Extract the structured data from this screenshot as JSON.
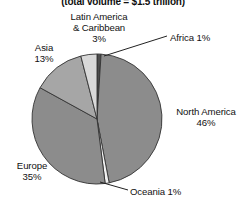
{
  "chart_data": {
    "type": "pie",
    "title": "(total volume = $1.5 trillion)",
    "subtitle": "",
    "xlabel": "",
    "ylabel": "",
    "legend_position": "none",
    "grid": false,
    "categories": [
      "Africa",
      "North America",
      "Oceania",
      "Europe",
      "Asia",
      "Latin America & Caribbean"
    ],
    "values": [
      1,
      46,
      1,
      35,
      13,
      3
    ],
    "units": "percent",
    "slices": [
      {
        "name": "Africa",
        "label_line1": "Africa 1%",
        "label_line2": "",
        "value": 1,
        "percent_text": "1%",
        "color": "#4d4d4d",
        "start_deg": 0,
        "end_deg": 3.6,
        "has_leader_line": true
      },
      {
        "name": "North America",
        "label_line1": "North America",
        "label_line2": "46%",
        "value": 46,
        "percent_text": "46%",
        "color": "#8c8c8c",
        "start_deg": 3.6,
        "end_deg": 169.2,
        "has_leader_line": false
      },
      {
        "name": "Oceania",
        "label_line1": "Oceania 1%",
        "label_line2": "",
        "value": 1,
        "percent_text": "1%",
        "color": "#f2f2f2",
        "start_deg": 169.2,
        "end_deg": 172.8,
        "has_leader_line": true
      },
      {
        "name": "Europe",
        "label_line1": "Europe",
        "label_line2": "35%",
        "value": 35,
        "percent_text": "35%",
        "color": "#8c8c8c",
        "start_deg": 172.8,
        "end_deg": 298.8,
        "has_leader_line": false
      },
      {
        "name": "Asia",
        "label_line1": "Asia",
        "label_line2": "13%",
        "value": 13,
        "percent_text": "13%",
        "color": "#a6a6a6",
        "start_deg": 298.8,
        "end_deg": 345.6,
        "has_leader_line": false
      },
      {
        "name": "Latin America & Caribbean",
        "label_line1": "Latin America",
        "label_line2": "& Caribbean",
        "label_line3": "3%",
        "value": 3,
        "percent_text": "3%",
        "color": "#d9d9d9",
        "start_deg": 345.6,
        "end_deg": 360,
        "has_leader_line": false
      }
    ],
    "geometry": {
      "center_x": 97,
      "center_y": 119,
      "radius": 65
    },
    "style": {
      "slice_outline_color": "#333333",
      "background": "#ffffff",
      "leader_line_color": "#222222"
    }
  },
  "labels": {
    "latin_america_line1": "Latin America",
    "latin_america_line2": "& Caribbean",
    "latin_america_pct": "3%",
    "africa": "Africa 1%",
    "asia_name": "Asia",
    "asia_pct": "13%",
    "europe_name": "Europe",
    "europe_pct": "35%",
    "north_america_name": "North America",
    "north_america_pct": "46%",
    "oceania": "Oceania 1%"
  }
}
